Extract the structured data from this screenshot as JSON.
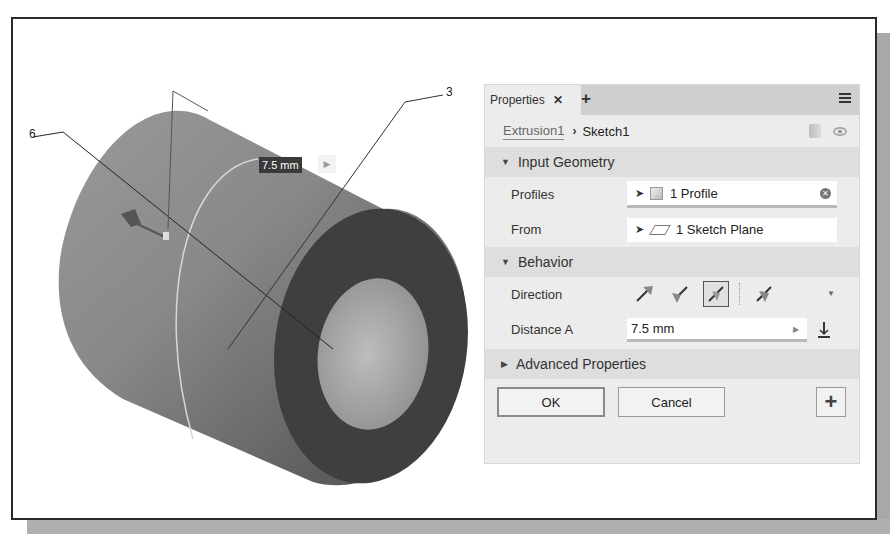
{
  "viewport": {
    "dimension_label": "7.5 mm",
    "callouts": [
      {
        "id": "6",
        "label": "6"
      },
      {
        "id": "3",
        "label": "3"
      }
    ]
  },
  "panel": {
    "tab_label": "Properties",
    "tab_close": "✕",
    "tab_add": "+",
    "breadcrumb": {
      "feature": "Extrusion1",
      "separator": "›",
      "sketch": "Sketch1"
    },
    "sections": {
      "input_geometry": {
        "title": "Input Geometry",
        "rows": {
          "profiles": {
            "label": "Profiles",
            "value": "1 Profile"
          },
          "from": {
            "label": "From",
            "value": "1 Sketch Plane"
          }
        }
      },
      "behavior": {
        "title": "Behavior",
        "direction_label": "Direction",
        "direction_options": [
          "default",
          "flipped",
          "symmetric",
          "asymmetric"
        ],
        "direction_selected": "symmetric",
        "distance_label": "Distance A",
        "distance_value": "7.5 mm"
      },
      "advanced": {
        "title": "Advanced Properties"
      }
    },
    "buttons": {
      "ok": "OK",
      "cancel": "Cancel",
      "apply": "+"
    }
  },
  "colors": {
    "panel_bg": "#ececec",
    "tabbar_bg": "#cfcfcf",
    "section_bg": "#dedede",
    "solid_dark": "#3a3a3a",
    "solid_mid": "#7a7a7a",
    "solid_light": "#a5a5a5"
  }
}
